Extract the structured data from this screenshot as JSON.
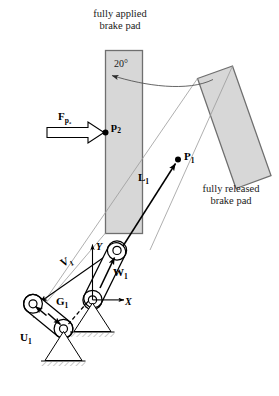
{
  "figure": {
    "name": "brake-pad-four-bar-linkage-diagram",
    "background": "#ffffff",
    "width": 279,
    "height": 396
  },
  "colors": {
    "pad_fill": "#d7d7d7",
    "pad_stroke": "#6f6f6f",
    "link_stroke": "#000000",
    "construction_line": "#9a9a9a",
    "text": "#1a1a1a",
    "ground_hatch": "#8c8c8c"
  },
  "captions": {
    "applied_pad": "fully applied\nbrake pad",
    "released_pad": "fully released\nbrake pad"
  },
  "annotations": {
    "rotation_angle": "20°"
  },
  "points": {
    "p2_label": "p",
    "p2_sub": "2",
    "p1_label": "P",
    "p1_sub": "1"
  },
  "vectors": {
    "force": {
      "label": "F",
      "sub": "p₂"
    },
    "L1": {
      "label": "L",
      "sub": "1"
    },
    "V1": {
      "label": "V",
      "sub": "1"
    },
    "W1": {
      "label": "W",
      "sub": "1"
    },
    "U1": {
      "label": "U",
      "sub": "1"
    },
    "G1": {
      "label": "G",
      "sub": "1"
    }
  },
  "axes": {
    "x": "X",
    "y": "Y"
  }
}
